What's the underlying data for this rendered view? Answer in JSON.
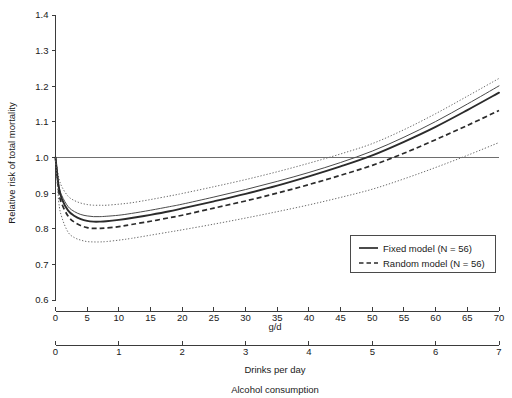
{
  "chart_data": {
    "type": "line",
    "title": "",
    "ylabel": "Relative risk of total mortality",
    "ylim": [
      0.6,
      1.4
    ],
    "y_ticks": [
      "0.6",
      "0.7",
      "0.8",
      "0.9",
      "1.0",
      "1.1",
      "1.2",
      "1.3",
      "1.4"
    ],
    "y_tick_values": [
      0.6,
      0.7,
      0.8,
      0.9,
      1.0,
      1.1,
      1.2,
      1.3,
      1.4
    ],
    "grid": false,
    "reference_line_y": 1.0,
    "axes": [
      {
        "name": "grams-per-day",
        "label": "g/d",
        "xlim": [
          0,
          70
        ],
        "ticks": [
          "0",
          "5",
          "10",
          "15",
          "20",
          "25",
          "30",
          "35",
          "40",
          "45",
          "50",
          "55",
          "60",
          "65",
          "70"
        ],
        "tick_values": [
          0,
          5,
          10,
          15,
          20,
          25,
          30,
          35,
          40,
          45,
          50,
          55,
          60,
          65,
          70
        ]
      },
      {
        "name": "drinks-per-day",
        "label": "Drinks per day",
        "xlim": [
          0,
          7
        ],
        "ticks": [
          "0",
          "1",
          "2",
          "3",
          "4",
          "5",
          "6",
          "7"
        ],
        "tick_values": [
          0,
          1,
          2,
          3,
          4,
          5,
          6,
          7
        ]
      }
    ],
    "overall_axis_label": "Alcohol consumption",
    "legend": {
      "position": "bottom-right",
      "entries": [
        {
          "name": "fixed-model",
          "label": "Fixed model (N = 56)",
          "style": "solid"
        },
        {
          "name": "random-model",
          "label": "Random model (N = 56)",
          "style": "dashed"
        }
      ]
    },
    "x": [
      0,
      0.5,
      1,
      2,
      3,
      4,
      5,
      6,
      7,
      8,
      10,
      12,
      15,
      18,
      20,
      25,
      30,
      35,
      40,
      45,
      50,
      55,
      60,
      65,
      70
    ],
    "series": [
      {
        "name": "Fixed model upper 95% CI",
        "style": "dotted",
        "values": [
          1.0,
          0.945,
          0.918,
          0.891,
          0.879,
          0.872,
          0.868,
          0.866,
          0.866,
          0.866,
          0.869,
          0.873,
          0.882,
          0.892,
          0.899,
          0.918,
          0.938,
          0.96,
          0.984,
          1.01,
          1.039,
          1.078,
          1.123,
          1.172,
          1.222
        ]
      },
      {
        "name": "Random model upper bound curve",
        "style": "solid-thin",
        "values": [
          1.0,
          0.925,
          0.893,
          0.862,
          0.848,
          0.84,
          0.836,
          0.834,
          0.834,
          0.835,
          0.838,
          0.843,
          0.852,
          0.862,
          0.869,
          0.889,
          0.91,
          0.933,
          0.958,
          0.986,
          1.018,
          1.057,
          1.101,
          1.15,
          1.201
        ]
      },
      {
        "name": "Fixed model",
        "style": "solid",
        "values": [
          1.0,
          0.918,
          0.884,
          0.851,
          0.836,
          0.827,
          0.822,
          0.82,
          0.82,
          0.821,
          0.825,
          0.83,
          0.839,
          0.849,
          0.857,
          0.877,
          0.898,
          0.921,
          0.947,
          0.975,
          1.006,
          1.044,
          1.086,
          1.133,
          1.182
        ]
      },
      {
        "name": "Random model",
        "style": "dashed",
        "values": [
          1.0,
          0.906,
          0.87,
          0.835,
          0.818,
          0.809,
          0.803,
          0.801,
          0.801,
          0.802,
          0.806,
          0.812,
          0.821,
          0.831,
          0.838,
          0.858,
          0.878,
          0.9,
          0.924,
          0.95,
          0.978,
          1.012,
          1.05,
          1.09,
          1.132
        ]
      },
      {
        "name": "Fixed model lower 95% CI",
        "style": "dotted",
        "values": [
          1.0,
          0.878,
          0.832,
          0.79,
          0.775,
          0.768,
          0.764,
          0.763,
          0.763,
          0.764,
          0.768,
          0.773,
          0.782,
          0.791,
          0.797,
          0.813,
          0.83,
          0.848,
          0.867,
          0.888,
          0.911,
          0.94,
          0.972,
          1.006,
          1.042
        ]
      }
    ]
  }
}
